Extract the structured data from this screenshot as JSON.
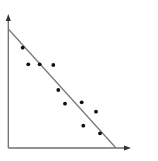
{
  "chart_data": {
    "type": "scatter",
    "title": "",
    "xlabel": "",
    "ylabel": "",
    "grid": false,
    "legend": null,
    "axis_style": "arrows, no ticks, no tick labels",
    "points_pixel": [
      {
        "x": 22.7,
        "y": 47.7
      },
      {
        "x": 28.3,
        "y": 64.3
      },
      {
        "x": 39.7,
        "y": 64.3
      },
      {
        "x": 53.3,
        "y": 65.0
      },
      {
        "x": 58.3,
        "y": 90.0
      },
      {
        "x": 65.0,
        "y": 103.7
      },
      {
        "x": 81.7,
        "y": 102.3
      },
      {
        "x": 96.0,
        "y": 111.7
      },
      {
        "x": 83.3,
        "y": 125.7
      },
      {
        "x": 100.0,
        "y": 133.3
      }
    ],
    "series": [
      {
        "name": "observations",
        "x": [
          0.12,
          0.17,
          0.26,
          0.37,
          0.41,
          0.47,
          0.6,
          0.72,
          0.62,
          0.75
        ],
        "y": [
          0.75,
          0.63,
          0.63,
          0.62,
          0.43,
          0.33,
          0.34,
          0.27,
          0.17,
          0.11
        ]
      }
    ],
    "trend_line": {
      "name": "fitted line",
      "slope_sign": "negative",
      "start_pixel": {
        "x": 8.3,
        "y": 29.0
      },
      "end_pixel": {
        "x": 116.0,
        "y": 148.0
      },
      "start": {
        "x": 0.0,
        "y": 0.89
      },
      "end": {
        "x": 0.88,
        "y": 0.0
      }
    },
    "xlim": [
      0,
      1
    ],
    "ylim": [
      0,
      1
    ]
  },
  "style": {
    "axis_color": "#6e6e6e",
    "line_color": "#7a7a7a",
    "point_color": "#111111",
    "background": "#ffffff"
  },
  "layout": {
    "origin": {
      "x": 8.3,
      "y": 148.0
    },
    "y_axis_top": 15.0,
    "x_axis_right": 130.0
  }
}
